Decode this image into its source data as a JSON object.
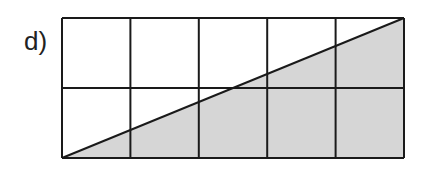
{
  "label": "d)",
  "grid": {
    "columns": 5,
    "rows": 2,
    "x0": 62,
    "y0": 18,
    "x1": 404,
    "y1": 158,
    "line_color": "#1a1a1a",
    "fill_color": "#d6d6d6"
  },
  "shaded_region": {
    "shape": "triangle",
    "points": [
      [
        62,
        158
      ],
      [
        404,
        158
      ],
      [
        404,
        18
      ]
    ],
    "description": "Right triangle below the diagonal from bottom-left to top-right is shaded"
  }
}
